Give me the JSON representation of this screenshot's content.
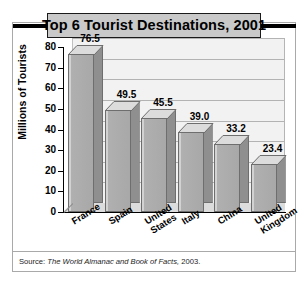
{
  "figure": {
    "title": "Top 6 Tourist Destinations, 2001",
    "source_prefix": "Source:",
    "source_italic": "The World Almanac and Book of Facts,",
    "source_suffix": "2003."
  },
  "chart_data": {
    "type": "bar",
    "title": "Top 6 Tourist Destinations, 2001",
    "xlabel": "",
    "ylabel": "Millions of Tourists",
    "categories": [
      "France",
      "Spain",
      "United States",
      "Italy",
      "China",
      "United Kingdom"
    ],
    "category_lines": [
      [
        "France"
      ],
      [
        "Spain"
      ],
      [
        "United",
        "States"
      ],
      [
        "Italy"
      ],
      [
        "China"
      ],
      [
        "United",
        "Kingdom"
      ]
    ],
    "values": [
      76.5,
      49.5,
      45.5,
      39.0,
      33.2,
      23.4
    ],
    "value_labels": [
      "76.5",
      "49.5",
      "45.5",
      "39.0",
      "33.2",
      "23.4"
    ],
    "ylim": [
      0,
      80
    ],
    "yticks": [
      0,
      10,
      20,
      30,
      40,
      50,
      60,
      70,
      80
    ],
    "ytick_labels": [
      "0",
      "10",
      "20",
      "30",
      "40",
      "50",
      "60",
      "70",
      "80"
    ],
    "grid": true,
    "legend": false,
    "style": "3d-column",
    "colors": {
      "bar_face": "#a8a8a8",
      "bar_side": "#8f8f8f",
      "bar_top": "#dcdcdc",
      "bar_edge": "#6e6e6e",
      "plot_background": "#f2f2f2",
      "gridline": "#b3b3b3",
      "title_banner": "#c9c9c9",
      "axis": "#000000"
    }
  }
}
